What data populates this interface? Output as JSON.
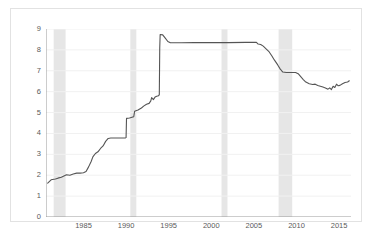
{
  "chart_data": {
    "type": "line",
    "title": "",
    "subtitle": "",
    "xlabel": "",
    "ylabel": "",
    "xlim": [
      1980.6,
      2016.4
    ],
    "ylim": [
      0,
      9
    ],
    "grid": true,
    "legend": "none",
    "x_ticks": [
      1985,
      1990,
      1995,
      2000,
      2005,
      2010,
      2015
    ],
    "x_tick_labels": [
      "1985",
      "1990",
      "1995",
      "2000",
      "2005",
      "2010",
      "2015"
    ],
    "y_ticks": [
      0,
      1,
      2,
      3,
      4,
      5,
      6,
      7,
      8,
      9
    ],
    "y_tick_labels": [
      "0",
      "1",
      "2",
      "3",
      "4",
      "5",
      "6",
      "7",
      "8",
      "9"
    ],
    "line_color": "#555555",
    "line_width": 1.1,
    "shade_color": "#e6e6e6",
    "grid_color": "#f1f1f1",
    "axis_color": "#9a9a9a",
    "shaded_regions": [
      {
        "name": "recession-1981-1982",
        "x0": 1981.5,
        "x1": 1982.9
      },
      {
        "name": "recession-1990-1991",
        "x0": 1990.5,
        "x1": 1991.2
      },
      {
        "name": "recession-2001",
        "x0": 2001.2,
        "x1": 2001.9
      },
      {
        "name": "recession-2007-2009",
        "x0": 2007.9,
        "x1": 2009.5
      }
    ],
    "series": [
      {
        "name": "value",
        "points": [
          [
            1980.8,
            1.62
          ],
          [
            1981.2,
            1.78
          ],
          [
            1981.7,
            1.82
          ],
          [
            1982.0,
            1.86
          ],
          [
            1982.4,
            1.9
          ],
          [
            1982.7,
            1.96
          ],
          [
            1983.0,
            2.02
          ],
          [
            1983.4,
            2.0
          ],
          [
            1983.8,
            2.06
          ],
          [
            1984.2,
            2.1
          ],
          [
            1984.6,
            2.1
          ],
          [
            1985.0,
            2.12
          ],
          [
            1985.3,
            2.18
          ],
          [
            1985.6,
            2.4
          ],
          [
            1985.9,
            2.66
          ],
          [
            1986.1,
            2.88
          ],
          [
            1986.4,
            3.04
          ],
          [
            1986.7,
            3.12
          ],
          [
            1987.0,
            3.28
          ],
          [
            1987.3,
            3.4
          ],
          [
            1987.6,
            3.62
          ],
          [
            1987.9,
            3.76
          ],
          [
            1988.2,
            3.78
          ],
          [
            1989.0,
            3.78
          ],
          [
            1989.9,
            3.78
          ],
          [
            1990.0,
            3.8
          ],
          [
            1990.05,
            4.72
          ],
          [
            1990.4,
            4.74
          ],
          [
            1990.7,
            4.78
          ],
          [
            1990.9,
            4.8
          ],
          [
            1991.0,
            5.06
          ],
          [
            1991.4,
            5.12
          ],
          [
            1991.8,
            5.22
          ],
          [
            1992.1,
            5.32
          ],
          [
            1992.4,
            5.4
          ],
          [
            1992.7,
            5.44
          ],
          [
            1992.9,
            5.56
          ],
          [
            1993.0,
            5.72
          ],
          [
            1993.2,
            5.62
          ],
          [
            1993.4,
            5.74
          ],
          [
            1993.6,
            5.78
          ],
          [
            1993.8,
            5.8
          ],
          [
            1993.9,
            5.86
          ],
          [
            1993.95,
            8.1
          ],
          [
            1994.0,
            8.74
          ],
          [
            1994.3,
            8.72
          ],
          [
            1994.6,
            8.56
          ],
          [
            1994.9,
            8.4
          ],
          [
            1995.2,
            8.34
          ],
          [
            1995.6,
            8.34
          ],
          [
            1996.5,
            8.34
          ],
          [
            1998.0,
            8.35
          ],
          [
            2000.0,
            8.35
          ],
          [
            2002.0,
            8.35
          ],
          [
            2004.0,
            8.36
          ],
          [
            2005.3,
            8.36
          ],
          [
            2005.5,
            8.28
          ],
          [
            2005.8,
            8.26
          ],
          [
            2006.1,
            8.18
          ],
          [
            2006.4,
            8.06
          ],
          [
            2006.8,
            7.9
          ],
          [
            2007.1,
            7.72
          ],
          [
            2007.4,
            7.52
          ],
          [
            2007.8,
            7.28
          ],
          [
            2008.1,
            7.08
          ],
          [
            2008.4,
            6.94
          ],
          [
            2008.8,
            6.92
          ],
          [
            2009.4,
            6.92
          ],
          [
            2009.9,
            6.92
          ],
          [
            2010.2,
            6.86
          ],
          [
            2010.5,
            6.72
          ],
          [
            2010.8,
            6.58
          ],
          [
            2011.1,
            6.46
          ],
          [
            2011.5,
            6.38
          ],
          [
            2011.9,
            6.34
          ],
          [
            2012.2,
            6.36
          ],
          [
            2012.5,
            6.3
          ],
          [
            2012.8,
            6.26
          ],
          [
            2013.1,
            6.22
          ],
          [
            2013.4,
            6.18
          ],
          [
            2013.7,
            6.12
          ],
          [
            2013.9,
            6.18
          ],
          [
            2014.1,
            6.1
          ],
          [
            2014.3,
            6.26
          ],
          [
            2014.5,
            6.2
          ],
          [
            2014.7,
            6.36
          ],
          [
            2014.9,
            6.28
          ],
          [
            2015.1,
            6.3
          ],
          [
            2015.4,
            6.38
          ],
          [
            2015.7,
            6.44
          ],
          [
            2016.0,
            6.46
          ],
          [
            2016.2,
            6.52
          ]
        ]
      }
    ]
  }
}
